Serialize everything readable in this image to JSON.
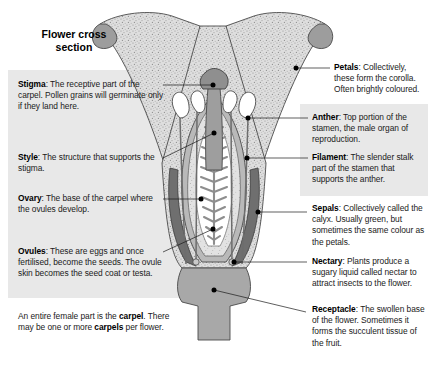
{
  "figure": {
    "title_line1": "Flower cross",
    "title_line2": "section",
    "caption": "An entire female part is the carpel. There may be one or more carpels per flower.",
    "caption_parts": {
      "p1": "An entire female part is the ",
      "b1": "carpel",
      "p2": ". There may be one or more ",
      "b2": "carpels",
      "p3": " per flower."
    }
  },
  "colors": {
    "panel_bg": "#e8e8e8",
    "petal_fill": "#dcdcdc",
    "petal_stipple": "#9a9a9a",
    "sepal_dark": "#707070",
    "style_gray": "#9e9e9e",
    "ovary_fill": "#c9c9c9",
    "receptacle": "#a8a8a8",
    "anther_white": "#ffffff",
    "outline": "#3a3a3a",
    "leader": "#1a1a1a",
    "text": "#1a1a1a"
  },
  "labels": {
    "left": [
      {
        "id": "stigma",
        "term": "Stigma",
        "text": ": The receptive part of the carpel. Pollen grains will germinate only if they land here."
      },
      {
        "id": "style",
        "term": "Style",
        "text": ": The structure that supports the stigma."
      },
      {
        "id": "ovary",
        "term": "Ovary",
        "text": ": The base of the carpel where the ovules develop."
      },
      {
        "id": "ovules",
        "term": "Ovules",
        "text": ": These are eggs and once fertilised, become the seeds. The ovule skin becomes the seed coat or testa."
      }
    ],
    "right": [
      {
        "id": "petals",
        "term": "Petals",
        "text": ": Collectively, these form the corolla. Often brightly coloured."
      },
      {
        "id": "anther",
        "term": "Anther",
        "text": ": Top portion of the stamen, the male organ of reproduction."
      },
      {
        "id": "filament",
        "term": "Filament",
        "text": ": The slender stalk part of the stamen that supports the anther."
      },
      {
        "id": "sepals",
        "term": "Sepals",
        "text": ": Collectively called the calyx. Usually green, but sometimes the same colour as the petals."
      },
      {
        "id": "nectary",
        "term": "Nectary",
        "text": ": Plants produce a sugary liquid called nectar to attract insects to the flower."
      },
      {
        "id": "receptacle",
        "term": "Receptacle",
        "text": ": The swollen base of the flower. Sometimes it forms the succulent tissue of the fruit."
      }
    ]
  }
}
